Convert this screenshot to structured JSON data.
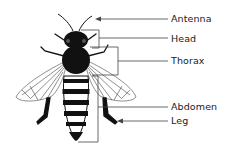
{
  "colors": {
    "ink": "#111111",
    "line": "#333333",
    "background": "#ffffff"
  },
  "labels": [
    {
      "id": "antenna",
      "text": "Antenna",
      "x": 171,
      "y": 14
    },
    {
      "id": "head",
      "text": "Head",
      "x": 171,
      "y": 34
    },
    {
      "id": "thorax",
      "text": "Thorax",
      "x": 171,
      "y": 56
    },
    {
      "id": "abdomen",
      "text": "Abdomen",
      "x": 171,
      "y": 102
    },
    {
      "id": "leg",
      "text": "Leg",
      "x": 171,
      "y": 116
    }
  ]
}
